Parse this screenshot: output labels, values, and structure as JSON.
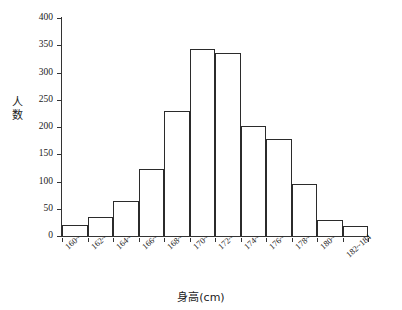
{
  "chart_data": {
    "type": "bar",
    "title": "",
    "xlabel": "身高(cm)",
    "ylabel": "人数",
    "categories": [
      "160~",
      "162~",
      "164~",
      "166~",
      "168~",
      "170~",
      "172~",
      "174~",
      "176~",
      "178~",
      "180~",
      "182~184"
    ],
    "values": [
      20,
      35,
      65,
      123,
      230,
      343,
      336,
      202,
      178,
      96,
      30,
      18
    ],
    "ylim": [
      0,
      400
    ],
    "yticks": [
      0,
      50,
      100,
      150,
      200,
      250,
      300,
      350,
      400
    ],
    "ytick_labels": [
      "0",
      "50",
      "100",
      "150",
      "200",
      "250",
      "300",
      "350",
      "400"
    ],
    "grid": false,
    "legend": false,
    "bar_fill_color": "#ffffff",
    "bar_edge_color": "#2b2b2b",
    "axis_color": "#333333"
  }
}
